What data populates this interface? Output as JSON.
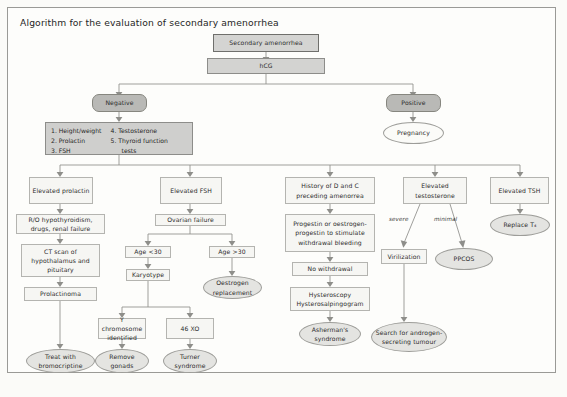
{
  "page": {
    "title": "Algorithm for the evaluation of secondary amenorrhea"
  },
  "nodes": {
    "secondary_amenorrhea": "Secondary amenorrhea",
    "hcg": "hCG",
    "negative": "Negative",
    "positive": "Positive",
    "pregnancy": "Pregnancy",
    "workup_list": {
      "col1": [
        "1. Height/weight",
        "2. Prolactin",
        "3. FSH"
      ],
      "col2": [
        "4. Testosterone",
        "5. Thyroid function",
        "tests"
      ]
    },
    "elevated_prolactin": "Elevated prolactin",
    "ro_hypothyroidism": "R/O hypothyroidism, drugs, renal failure",
    "ct_scan": "CT scan of hypothalamus and pituitary",
    "prolactinoma": "Prolactinoma",
    "treat_bromocriptine": "Treat with bromocriptine",
    "elevated_fsh": "Elevated FSH",
    "ovarian_failure": "Ovarian failure",
    "age_under_30": "Age <30",
    "age_over_30": "Age >30",
    "karyotype": "Karyotype",
    "oestrogen_replacement": "Oestrogen replacement",
    "y_chromosome": "Y chromosome identified",
    "forty_six_xo": "46 XO",
    "remove_gonads": "Remove gonads",
    "turner_syndrome": "Turner syndrome",
    "history_d_and_c": "History of D and C preceding amenorrea",
    "progestin": "Progestin or oestrogen-progestin to stimulate withdrawal bleeding",
    "no_withdrawal": "No withdrawal",
    "hysteroscopy": "Hysteroscopy Hysterosalpingogram",
    "ashermans": "Asherman's syndrome",
    "elevated_testosterone": "Elevated testosterone",
    "label_severe": "severe",
    "label_minimal": "minimal",
    "virilization": "Virilization",
    "pcos": "PPCOS",
    "search_androgen": "Search for androgen-secreting tumour",
    "elevated_tsh": "Elevated TSH",
    "replace_t4": "Replace T₄"
  },
  "colors": {
    "page_bg": "#fbfbf8",
    "frame_border": "#9a9a96",
    "box_fill": "#fcfcfa",
    "shaded_fill": "#cfcfcd",
    "oval_fill": "#e9e9e6",
    "dark_pill": "#b9b9b6",
    "line": "#8e8e8a",
    "text": "#2b2b2b"
  }
}
